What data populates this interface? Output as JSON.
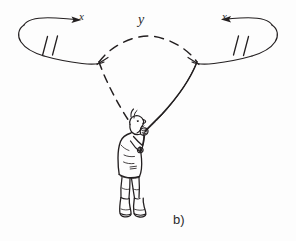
{
  "figure": {
    "caption": "b)",
    "labels": {
      "arc_label": "y",
      "left_tip_label": "x",
      "right_tip_label": "x"
    },
    "colors": {
      "ink": "#231f20",
      "background": "#fdfdfd",
      "label_text": "#2b2b2b"
    },
    "style": "hand-drawn pen sketch",
    "elements": [
      {
        "name": "person",
        "description": "standing person in profile facing right, head tilted upward, arms raised holding a rod"
      },
      {
        "name": "left-line",
        "description": "dashed line from the hand rising up-left to the left junction",
        "stroke": "dashed"
      },
      {
        "name": "right-line",
        "description": "solid doubled line from the hand rising up-right to the right junction",
        "stroke": "solid"
      },
      {
        "name": "top-arc",
        "description": "dashed arc spanning between the left and right junctions",
        "stroke": "dashed"
      },
      {
        "name": "left-loop",
        "description": "elongated loop extending left, ending in a rightward arrowhead"
      },
      {
        "name": "right-loop",
        "description": "elongated loop extending right, ending in a leftward arrowhead"
      },
      {
        "name": "left-break-marks",
        "description": "pair of slanted parallel tick marks across the left loop"
      },
      {
        "name": "right-break-marks",
        "description": "pair of slanted parallel tick marks across the right loop"
      }
    ]
  }
}
